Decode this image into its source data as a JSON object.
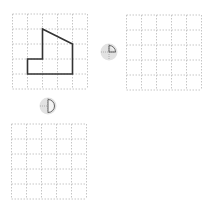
{
  "grids": [
    {
      "name": "original-grid",
      "cols": 5,
      "rows": 5,
      "x": 12,
      "y": 14
    },
    {
      "name": "rotated-quarter-grid",
      "cols": 5,
      "rows": 5,
      "x": 126,
      "y": 15
    },
    {
      "name": "rotated-half-grid",
      "cols": 5,
      "rows": 5,
      "x": 11,
      "y": 124
    }
  ],
  "shape": {
    "description": "pentagon-like polygon with a notch",
    "grid_vertices": [
      [
        2,
        1
      ],
      [
        4,
        2
      ],
      [
        4,
        4
      ],
      [
        1,
        4
      ],
      [
        1,
        3
      ],
      [
        2,
        3
      ]
    ],
    "stroke": "#333333"
  },
  "rotation_icons": [
    {
      "name": "quarter-turn-icon",
      "turn": "1/4",
      "x": 101,
      "y": 43
    },
    {
      "name": "half-turn-icon",
      "turn": "1/2",
      "x": 39,
      "y": 97
    }
  ],
  "colors": {
    "grid_line": "#b8b8b8",
    "shape_line": "#333333",
    "icon_fill": "#d9d9d9",
    "icon_line": "#555555"
  }
}
